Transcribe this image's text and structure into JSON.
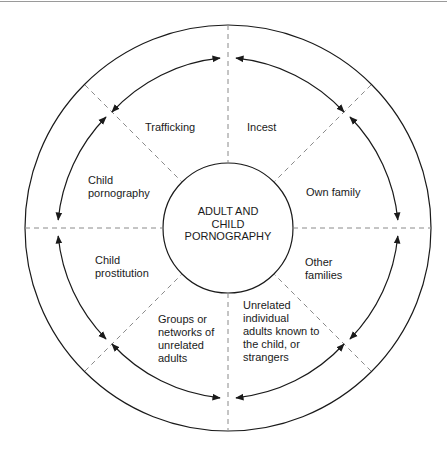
{
  "diagram": {
    "center_label": "ADULT AND\nCHILD\nPORNOGRAPHY",
    "segments": [
      {
        "id": "trafficking",
        "label": "Trafficking"
      },
      {
        "id": "incest",
        "label": "Incest"
      },
      {
        "id": "own-family",
        "label": "Own family"
      },
      {
        "id": "other-families",
        "label": "Other\nfamilies"
      },
      {
        "id": "unrelated-individuals",
        "label": "Unrelated\nindividual\nadults known to\nthe child, or\nstrangers"
      },
      {
        "id": "groups-networks",
        "label": "Groups or\nnetworks of\nunrelated\nadults"
      },
      {
        "id": "child-prostitution",
        "label": "Child\nprostitution"
      },
      {
        "id": "child-pornography",
        "label": "Child\npornography"
      }
    ],
    "colors": {
      "line": "#1a1a1a",
      "dashed": "#8a8a8a",
      "background": "#ffffff"
    }
  }
}
